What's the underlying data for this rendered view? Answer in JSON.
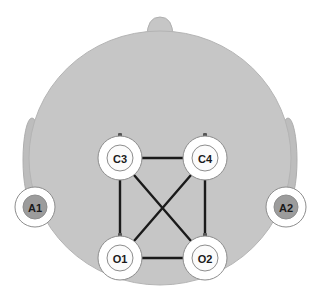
{
  "figure": {
    "type": "eeg-electrode-placement-head-diagram",
    "view": "top-down",
    "background_color": "#ffffff"
  },
  "head": {
    "name": "scalp-outline",
    "fill_color": "#c6c6c6",
    "stroke_color": "#b4b4b4",
    "center_x": 160,
    "center_y": 158,
    "radius_x": 131,
    "radius_y": 127
  },
  "nose": {
    "name": "nose-marker",
    "fill_color": "#c6c6c6",
    "stroke_color": "#b0b0b0",
    "x": 160,
    "y": 27,
    "width": 26,
    "height": 20
  },
  "ears": [
    {
      "name": "ear-left",
      "side": "left",
      "cx": 32,
      "cy": 160,
      "rx": 9,
      "ry": 42,
      "fill_color": "#bdbdbd",
      "stroke_color": "#aeaeae"
    },
    {
      "name": "ear-right",
      "side": "right",
      "cx": 288,
      "cy": 160,
      "rx": 9,
      "ry": 42,
      "fill_color": "#bdbdbd",
      "stroke_color": "#aeaeae"
    }
  ],
  "electrodes": [
    {
      "id": "C3",
      "label": "C3",
      "x": 120,
      "y": 158,
      "outer_radius": 22,
      "inner_radius": 13,
      "outer_fill": "#ffffff",
      "inner_fill": "#fbfbfb",
      "ring_stroke": "#8d8d8d",
      "has_connector_nub": true,
      "region": "central-left"
    },
    {
      "id": "C4",
      "label": "C4",
      "x": 205,
      "y": 158,
      "outer_radius": 22,
      "inner_radius": 13,
      "outer_fill": "#ffffff",
      "inner_fill": "#fbfbfb",
      "ring_stroke": "#8d8d8d",
      "has_connector_nub": true,
      "region": "central-right"
    },
    {
      "id": "O1",
      "label": "O1",
      "x": 120,
      "y": 258,
      "outer_radius": 22,
      "inner_radius": 13,
      "outer_fill": "#ffffff",
      "inner_fill": "#fbfbfb",
      "ring_stroke": "#8d8d8d",
      "has_connector_nub": true,
      "region": "occipital-left"
    },
    {
      "id": "O2",
      "label": "O2",
      "x": 205,
      "y": 258,
      "outer_radius": 22,
      "inner_radius": 13,
      "outer_fill": "#ffffff",
      "inner_fill": "#fbfbfb",
      "ring_stroke": "#8d8d8d",
      "has_connector_nub": true,
      "region": "occipital-right"
    }
  ],
  "reference_electrodes": [
    {
      "id": "A1",
      "label": "A1",
      "x": 35,
      "y": 207,
      "outer_radius": 20,
      "inner_radius": 12,
      "outer_fill": "#ffffff",
      "inner_fill": "#9c9c9c",
      "ring_stroke": "#8d8d8d",
      "region": "left-mastoid"
    },
    {
      "id": "A2",
      "label": "A2",
      "x": 286,
      "y": 207,
      "outer_radius": 20,
      "inner_radius": 12,
      "outer_fill": "#ffffff",
      "inner_fill": "#9c9c9c",
      "ring_stroke": "#8d8d8d",
      "region": "right-mastoid"
    }
  ],
  "connections": [
    {
      "name": "link-c3-c4",
      "from": "C3",
      "to": "C4",
      "x1": 142,
      "y1": 158,
      "x2": 183,
      "y2": 158
    },
    {
      "name": "link-c3-o1",
      "from": "C3",
      "to": "O1",
      "x1": 120,
      "y1": 180,
      "x2": 120,
      "y2": 236
    },
    {
      "name": "link-c4-o2",
      "from": "C4",
      "to": "O2",
      "x1": 205,
      "y1": 180,
      "x2": 205,
      "y2": 236
    },
    {
      "name": "link-o1-o2",
      "from": "O1",
      "to": "O2",
      "x1": 142,
      "y1": 258,
      "x2": 183,
      "y2": 258
    },
    {
      "name": "link-c3-o2",
      "from": "C3",
      "to": "O2",
      "x1": 134,
      "y1": 175,
      "x2": 191,
      "y2": 241
    },
    {
      "name": "link-c4-o1",
      "from": "C4",
      "to": "O1",
      "x1": 191,
      "y1": 175,
      "x2": 134,
      "y2": 241
    }
  ],
  "style": {
    "connection_color": "#1a1a1a",
    "connection_width": 2.4,
    "nub_color": "#555555"
  }
}
